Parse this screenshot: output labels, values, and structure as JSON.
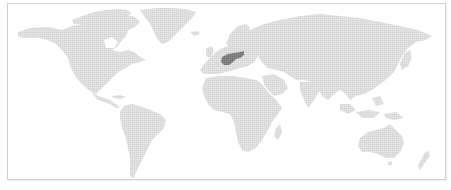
{
  "map": {
    "type": "dotted-world-map",
    "colors": {
      "background": "#ffffff",
      "frame_border": "#cfcfcf",
      "land": "#dcdcdc",
      "highlight": "#7a7a7a"
    },
    "highlighted_region": "German Empire (central Europe)",
    "regions": [
      {
        "name": "north-america",
        "highlighted": false
      },
      {
        "name": "greenland",
        "highlighted": false
      },
      {
        "name": "south-america",
        "highlighted": false
      },
      {
        "name": "europe",
        "highlighted": false
      },
      {
        "name": "africa",
        "highlighted": false
      },
      {
        "name": "asia",
        "highlighted": false
      },
      {
        "name": "australia",
        "highlighted": false
      },
      {
        "name": "german-empire",
        "highlighted": true
      }
    ]
  }
}
